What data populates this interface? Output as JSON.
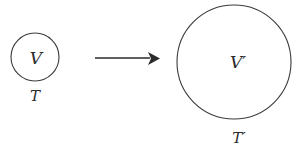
{
  "figure": {
    "type": "geometric-diagram",
    "background_color": "#ffffff",
    "stroke_color": "#3b3b3b",
    "text_color": "#2b2b2b"
  },
  "source_state": {
    "shape": "circle",
    "inner_label": "V",
    "outer_label": "T",
    "center_x": 35,
    "center_y": 57,
    "radius": 24
  },
  "transition": {
    "icon": "right-arrow-icon",
    "shaft_start_x": 95,
    "shaft_end_x": 150,
    "tip_x": 160,
    "y": 58
  },
  "target_state": {
    "shape": "circle",
    "inner_label": "V′",
    "outer_label": "T′",
    "center_x": 234,
    "center_y": 62,
    "radius": 57
  }
}
